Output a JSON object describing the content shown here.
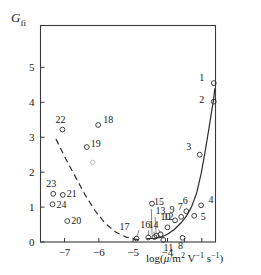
{
  "chart_data": {
    "type": "scatter",
    "title": "",
    "ylabel": "G_fi",
    "ylabel_base": "G",
    "ylabel_sub": "fi",
    "xlabel": "log(μ/m² V⁻¹ s⁻¹)",
    "xlabel_parts": {
      "prefix": "log(",
      "mu": "μ",
      "slash": "/m",
      "m_exp": "2",
      "volt": " V",
      "v_exp": "−1",
      "sec": " s",
      "s_exp": "−1",
      "suffix": ")"
    },
    "xlim": [
      -7.7,
      -2.6
    ],
    "ylim": [
      0,
      6.2
    ],
    "xticks": [
      -7,
      -6,
      -5,
      -4
    ],
    "xtick_labels": [
      "−7",
      "−6",
      "−5",
      "−4"
    ],
    "xticks_unlabeled": [
      -3.5,
      -3.0,
      -2.6
    ],
    "yticks": [
      0,
      1,
      2,
      3,
      4,
      5
    ],
    "ytick_labels": [
      "0",
      "1",
      "2",
      "3",
      "4",
      "5"
    ],
    "grid": false,
    "legend": "none",
    "marker_style": "open-circle",
    "points": [
      {
        "id": "1",
        "x": -2.65,
        "y": 4.55,
        "label_dx": -12,
        "label_dy": -2
      },
      {
        "id": "2",
        "x": -2.65,
        "y": 4.02,
        "label_dx": -12,
        "label_dy": 1
      },
      {
        "id": "3",
        "x": -3.06,
        "y": 2.5,
        "label_dx": -11,
        "label_dy": -5
      },
      {
        "id": "4",
        "x": -3.02,
        "y": 1.05,
        "label_dx": 10,
        "label_dy": -2
      },
      {
        "id": "5",
        "x": -3.22,
        "y": 0.75,
        "label_dx": 9,
        "label_dy": 4
      },
      {
        "id": "6",
        "x": -3.45,
        "y": 0.88,
        "label_dx": -1,
        "label_dy": -7
      },
      {
        "id": "7",
        "x": -3.6,
        "y": 0.72,
        "label_dx": -1,
        "label_dy": -7
      },
      {
        "id": "8",
        "x": -3.56,
        "y": 0.12,
        "label_dx": -2,
        "label_dy": 11
      },
      {
        "id": "9",
        "x": -3.78,
        "y": 0.62,
        "label_dx": -3,
        "label_dy": -7
      },
      {
        "id": "10",
        "x": -4.0,
        "y": 0.42,
        "label_dx": -2,
        "label_dy": -7
      },
      {
        "id": "11",
        "x": -4.12,
        "y": 0.06,
        "label_dx": 5,
        "label_dy": 11
      },
      {
        "id": "12",
        "x": -4.2,
        "y": 0.22,
        "label_dx": 8,
        "label_dy": -14
      },
      {
        "id": "13",
        "x": -4.32,
        "y": 0.18,
        "label_dx": 4,
        "label_dy": -22
      },
      {
        "id": "14",
        "x": -4.38,
        "y": 0.14,
        "label_dx": -1,
        "label_dy": -9
      },
      {
        "id": "15",
        "x": -4.45,
        "y": 1.1,
        "label_dx": 7,
        "label_dy": 1
      },
      {
        "id": "16",
        "x": -4.56,
        "y": 0.13,
        "label_dx": -3,
        "label_dy": -9
      },
      {
        "id": "17",
        "x": -4.9,
        "y": 0.1,
        "label_dx": -12,
        "label_dy": -9
      },
      {
        "id": "18",
        "x": -6.02,
        "y": 3.35,
        "label_dx": 10,
        "label_dy": -2
      },
      {
        "id": "19",
        "x": -6.35,
        "y": 2.72,
        "label_dx": 9,
        "label_dy": 0
      },
      {
        "id": "20",
        "x": -6.92,
        "y": 0.6,
        "label_dx": 9,
        "label_dy": 3
      },
      {
        "id": "21",
        "x": -7.05,
        "y": 1.35,
        "label_dx": 9,
        "label_dy": 2
      },
      {
        "id": "22",
        "x": -7.06,
        "y": 3.22,
        "label_dx": -2,
        "label_dy": -7
      },
      {
        "id": "23",
        "x": -7.33,
        "y": 1.38,
        "label_dx": -2,
        "label_dy": -7
      },
      {
        "id": "24",
        "x": -7.35,
        "y": 1.08,
        "label_dx": 9,
        "label_dy": 4
      }
    ],
    "extra_points": [
      {
        "x": -6.18,
        "y": 2.28,
        "faint": true
      }
    ],
    "fit_curve": {
      "name": "solid-fit-curve",
      "points": [
        [
          -4.6,
          0.1
        ],
        [
          -4.4,
          0.1
        ],
        [
          -4.2,
          0.13
        ],
        [
          -4.0,
          0.22
        ],
        [
          -3.8,
          0.36
        ],
        [
          -3.6,
          0.55
        ],
        [
          -3.45,
          0.74
        ],
        [
          -3.3,
          1.0
        ],
        [
          -3.15,
          1.4
        ],
        [
          -3.02,
          1.95
        ],
        [
          -2.9,
          2.6
        ],
        [
          -2.8,
          3.2
        ],
        [
          -2.72,
          3.7
        ],
        [
          -2.66,
          4.05
        ],
        [
          -2.62,
          4.4
        ]
      ]
    },
    "dashed_curve": {
      "name": "dashed-branch-curve",
      "points": [
        [
          -7.25,
          2.95
        ],
        [
          -7.0,
          2.45
        ],
        [
          -6.7,
          1.9
        ],
        [
          -6.4,
          1.35
        ],
        [
          -6.1,
          0.88
        ],
        [
          -5.8,
          0.52
        ],
        [
          -5.5,
          0.28
        ],
        [
          -5.2,
          0.14
        ],
        [
          -4.95,
          0.08
        ],
        [
          -4.75,
          0.06
        ]
      ]
    },
    "leaders": [
      {
        "from_id": "12",
        "x1": -4.26,
        "y1": 0.36,
        "x2": -4.21,
        "y2": 0.26
      },
      {
        "from_id": "13",
        "x1": -4.36,
        "y1": 0.72,
        "x2": -4.33,
        "y2": 0.24
      },
      {
        "from_id": "14",
        "x1": -4.39,
        "y1": 0.3,
        "x2": -4.39,
        "y2": 0.19
      },
      {
        "from_id": "16",
        "x1": -4.55,
        "y1": 0.33,
        "x2": -4.55,
        "y2": 0.18
      },
      {
        "from_id": "17",
        "x1": -4.83,
        "y1": 0.34,
        "x2": -4.89,
        "y2": 0.15
      },
      {
        "from_id": "11",
        "x1": -4.12,
        "y1": 0.14,
        "x2": -4.12,
        "y2": 0.1
      },
      {
        "from_id": "15",
        "x1": -4.47,
        "y1": 0.95,
        "x2": -4.45,
        "y2": 0.22
      }
    ]
  }
}
